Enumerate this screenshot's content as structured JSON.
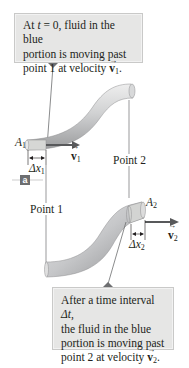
{
  "figure": {
    "top_callout": {
      "line1_prefix": "At ",
      "line1_var": "t",
      "line1_suffix": " = 0, fluid in the blue",
      "line2": "portion is moving past",
      "line3_prefix": "point 1 at velocity ",
      "line3_vec": "v",
      "line3_sub": "1",
      "line3_suffix": "."
    },
    "bottom_callout": {
      "line1_prefix": "After a time interval ",
      "line1_var": "Δt",
      "line1_suffix": ",",
      "line2": "the fluid in the blue",
      "line3": "portion is moving past",
      "line4_prefix": "point 2 at velocity ",
      "line4_vec": "v",
      "line4_sub": "2",
      "line4_suffix": "."
    },
    "labels": {
      "area1": "A",
      "area1_sub": "1",
      "area2": "A",
      "area2_sub": "2",
      "dx1": "Δx",
      "dx1_sub": "1",
      "dx2": "Δx",
      "dx2_sub": "2",
      "v1": "v",
      "v1_sub": "1",
      "v2": "v",
      "v2_sub": "2",
      "point1": "Point 1",
      "point2": "Point 2",
      "panel_badge": "a"
    },
    "colors": {
      "callout_bg": "#e6e6e5",
      "pipe_fill": "#c8c9cb",
      "pipe_highlight": "#eceded",
      "fluid_segment": "#d3d4d2",
      "arrow": "#58595b",
      "badge_bg": "#6d6e70",
      "line": "#6d6e70"
    }
  }
}
